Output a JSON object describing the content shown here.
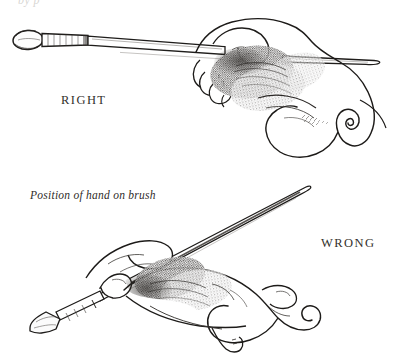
{
  "figure": {
    "title": "Position of hand on brush",
    "medium": "pen-and-ink instructional drawing",
    "background_color": "#ffffff",
    "ink_color": "#1d1b19",
    "width": 413,
    "height": 361
  },
  "top_fragment": {
    "text": "by p"
  },
  "panels": [
    {
      "id": "right-grip",
      "label": "RIGHT",
      "label_position": {
        "x": 61,
        "y": 93
      },
      "description": "Hand holding a long flat brush horizontally near the end of the handle, brush pointing left",
      "brush": {
        "orientation": "horizontal",
        "tip_type": "flat oval bristles",
        "tip_position": {
          "x": 14,
          "y": 40
        },
        "handle_end_position": {
          "x": 378,
          "y": 63
        }
      }
    },
    {
      "id": "wrong-grip",
      "label": "WRONG",
      "label_position": {
        "x": 321,
        "y": 236
      },
      "description": "Hand gripping brush like a pencil, brush angled steeply up to the right",
      "brush": {
        "orientation": "diagonal",
        "tip_type": "flat bristles",
        "tip_position": {
          "x": 31,
          "y": 295
        },
        "handle_end_position": {
          "x": 311,
          "y": 188
        }
      }
    }
  ],
  "caption": {
    "text": "Position of hand on brush",
    "style": "italic",
    "position": {
      "x": 30,
      "y": 189
    }
  }
}
